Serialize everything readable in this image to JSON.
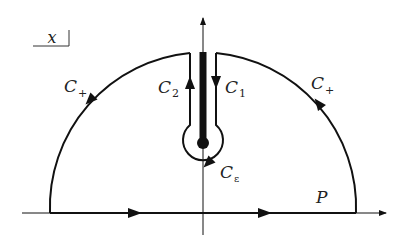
{
  "diagram": {
    "variable_box": "x",
    "labels": {
      "c_plus_left": {
        "main": "C",
        "sub": "+"
      },
      "c_plus_right": {
        "main": "C",
        "sub": "+"
      },
      "c1": {
        "main": "C",
        "sub": "1"
      },
      "c2": {
        "main": "C",
        "sub": "2"
      },
      "c_eps": {
        "main": "C",
        "sub": "ε"
      },
      "p": "P"
    },
    "colors": {
      "stroke": "#111111",
      "background": "#ffffff"
    }
  }
}
